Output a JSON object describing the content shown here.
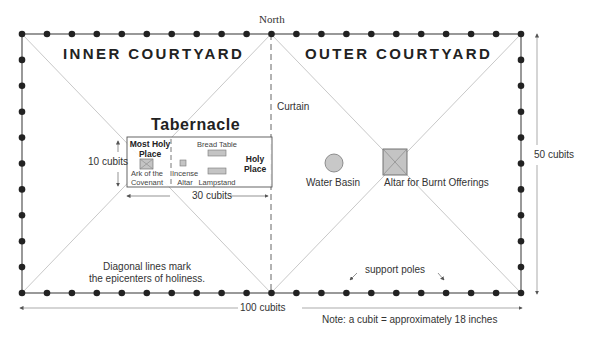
{
  "compass": {
    "north_label": "North"
  },
  "areas": {
    "inner_courtyard": "INNER COURTYARD",
    "outer_courtyard": "OUTER COURTYARD"
  },
  "tabernacle": {
    "title": "Tabernacle",
    "most_holy_place": "Most Holy Place",
    "most_holy_line1": "Most Holy",
    "most_holy_line2": "Place",
    "holy_place_line1": "Holy",
    "holy_place_line2": "Place",
    "ark_line1": "Ark of the",
    "ark_line2": "Covenant",
    "incense_line1": "Incense",
    "incense_line2": "Altar",
    "bread_table": "Bread Table",
    "lampstand": "Lampstand",
    "height_label": "10 cubits",
    "width_label": "30 cubits"
  },
  "curtain_label": "Curtain",
  "objects": {
    "water_basin": "Water Basin",
    "altar_burnt_offerings": "Altar for Burnt Offerings"
  },
  "dimensions": {
    "length": "100 cubits",
    "width": "50 cubits"
  },
  "annotations": {
    "diagonal_line1": "Diagonal lines mark",
    "diagonal_line2": "the epicenters of holiness.",
    "support_poles": "support poles",
    "note": "Note: a cubit = approximately 18 inches"
  },
  "poles": {
    "horizontal_count_per_side": 21,
    "vertical_count_per_side": 11
  },
  "colors": {
    "outline": "#555555",
    "pole": "#222222",
    "diagonal": "#bbbbbb",
    "fill_gray": "#c4c4c4",
    "text": "#222222"
  }
}
